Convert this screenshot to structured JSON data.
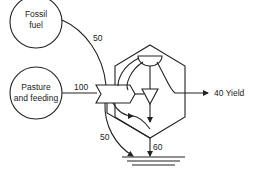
{
  "diagram": {
    "type": "energy-flow",
    "sources": [
      {
        "id": "fossil",
        "label_line1": "Fossil",
        "label_line2": "fuel"
      },
      {
        "id": "pasture",
        "label_line1": "Pasture",
        "label_line2": "and feeding"
      }
    ],
    "flows": {
      "fossil_in": "50",
      "pasture_in": "100",
      "interaction_to_sink": "50",
      "system_to_sink": "60",
      "yield_value": "40",
      "yield_label": "Yield"
    },
    "colors": {
      "stroke": "#222222",
      "background": "#ffffff"
    }
  }
}
